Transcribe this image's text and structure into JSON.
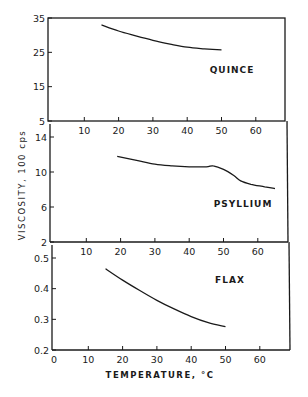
{
  "chart_data": [
    {
      "type": "line",
      "panel": "top",
      "label": "QUINCE",
      "xlabel": "TEMPERATURE, °C",
      "ylabel": "VISCOSITY, 100 cps",
      "xlim": [
        0,
        70
      ],
      "ylim": [
        5,
        35
      ],
      "xticks": [
        10,
        20,
        30,
        40,
        50,
        60
      ],
      "yticks": [
        5,
        15,
        25,
        35
      ],
      "grid": false,
      "series": [
        {
          "name": "Quince",
          "x": [
            15,
            20,
            25,
            30,
            35,
            40,
            45,
            50
          ],
          "y": [
            33.0,
            31.2,
            29.8,
            28.5,
            27.4,
            26.5,
            26.0,
            25.7
          ]
        }
      ]
    },
    {
      "type": "line",
      "panel": "middle",
      "label": "PSYLLIUM",
      "xlim": [
        0,
        70
      ],
      "ylim": [
        2,
        14
      ],
      "xticks": [
        10,
        20,
        30,
        40,
        50,
        60
      ],
      "yticks": [
        2,
        6,
        10,
        14
      ],
      "grid": false,
      "series": [
        {
          "name": "Psyllium",
          "x": [
            19,
            25,
            30,
            35,
            40,
            45,
            47,
            50,
            53,
            55,
            58,
            62,
            65
          ],
          "y": [
            11.8,
            11.3,
            10.9,
            10.7,
            10.6,
            10.6,
            10.7,
            10.3,
            9.6,
            9.0,
            8.6,
            8.3,
            8.1
          ]
        }
      ]
    },
    {
      "type": "line",
      "panel": "bottom",
      "label": "FLAX",
      "xlim": [
        0,
        70
      ],
      "ylim": [
        0.2,
        0.5
      ],
      "xticks": [
        0,
        10,
        20,
        30,
        40,
        50,
        60
      ],
      "yticks": [
        0.2,
        0.3,
        0.4,
        0.5
      ],
      "grid": false,
      "series": [
        {
          "name": "Flax",
          "x": [
            15,
            20,
            25,
            30,
            35,
            40,
            45,
            50
          ],
          "y": [
            0.465,
            0.428,
            0.394,
            0.362,
            0.334,
            0.309,
            0.289,
            0.276
          ]
        }
      ]
    }
  ],
  "figure": {
    "ylabel": "VISCOSITY,  100 cps",
    "xlabel": "TEMPERATURE,  °C",
    "panels": [
      {
        "label": "QUINCE",
        "yticks": [
          "35",
          "25",
          "15",
          "5"
        ],
        "xticks": [
          "10",
          "20",
          "30",
          "40",
          "50",
          "60"
        ]
      },
      {
        "label": "PSYLLIUM",
        "yticks": [
          "14",
          "10",
          "6",
          "2"
        ],
        "xticks": [
          "10",
          "20",
          "30",
          "40",
          "50",
          "60"
        ]
      },
      {
        "label": "FLAX",
        "yticks": [
          "0.5",
          "0.4",
          "0.3",
          "0.2"
        ],
        "xticks": [
          "0",
          "10",
          "20",
          "30",
          "40",
          "50",
          "60"
        ]
      }
    ]
  }
}
